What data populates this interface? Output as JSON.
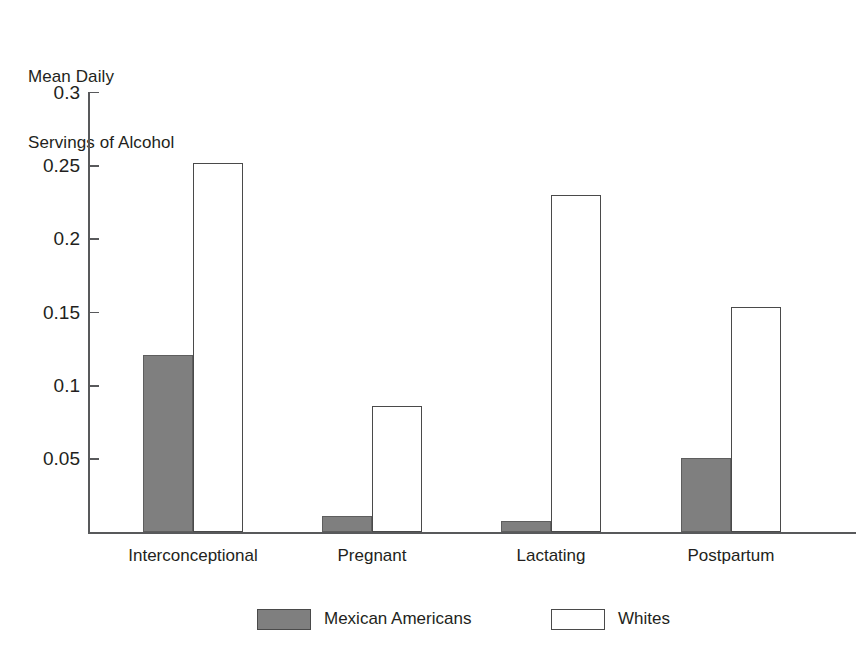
{
  "chart_data": {
    "type": "bar",
    "title": "",
    "ylabel_lines": [
      "Mean Daily",
      "Servings of Alcohol"
    ],
    "ylabel": "Mean Daily Servings of Alcohol",
    "xlabel": "",
    "categories": [
      "Interconceptional",
      "Pregnant",
      "Lactating",
      "Postpartum"
    ],
    "series": [
      {
        "name": "Mexican Americans",
        "style": "filled",
        "color": "#7f7f7f",
        "values": [
          0.121,
          0.011,
          0.008,
          0.051
        ]
      },
      {
        "name": "Whites",
        "style": "hollow",
        "color": "#ffffff",
        "values": [
          0.252,
          0.086,
          0.23,
          0.154
        ]
      }
    ],
    "ylim": [
      0,
      0.3
    ],
    "yticks": [
      0.05,
      0.1,
      0.15,
      0.2,
      0.25,
      0.3
    ],
    "ytick_labels": [
      "0.05",
      "0.1",
      "0.15",
      "0.2",
      "0.25",
      "0.3"
    ],
    "grid": false,
    "legend_position": "bottom"
  },
  "axis_title": {
    "line1": "Mean Daily",
    "line2": "Servings of Alcohol"
  },
  "yaxis": {
    "labels": [
      "0.3",
      "0.25",
      "0.2",
      "0.15",
      "0.1",
      "0.05"
    ]
  },
  "xaxis": {
    "labels": [
      "Interconceptional",
      "Pregnant",
      "Lactating",
      "Postpartum"
    ]
  },
  "legend": {
    "items": [
      {
        "label": "Mexican Americans",
        "swatch": "filled-gray-swatch"
      },
      {
        "label": "Whites",
        "swatch": "hollow-white-swatch"
      }
    ]
  },
  "colors": {
    "bar_fill_gray": "#7f7f7f",
    "bar_outline": "#4a4a4a",
    "axis": "#58595b",
    "text": "#231f20",
    "background": "#ffffff"
  }
}
